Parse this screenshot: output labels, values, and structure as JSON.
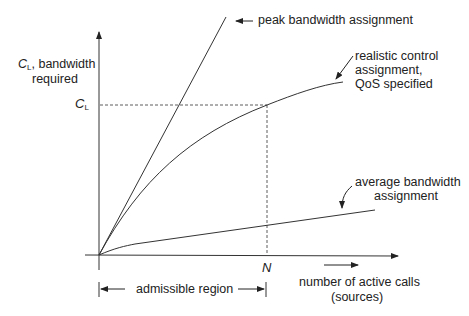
{
  "diagram": {
    "y_axis_label": {
      "symbol": "C",
      "subscript": "L",
      "text_line1": ", bandwidth",
      "text_line2": "required"
    },
    "y_marker": {
      "symbol": "C",
      "subscript": "L"
    },
    "x_marker": "N",
    "x_axis_label": {
      "line1": "number of active calls",
      "line2": "(sources)"
    },
    "region_label": "admissible region",
    "curves": [
      {
        "id": "peak",
        "label": "peak bandwidth assignment"
      },
      {
        "id": "realistic",
        "label_line1": "realistic control",
        "label_line2": "assignment,",
        "label_line3": "QoS specified"
      },
      {
        "id": "average",
        "label_line1": "average bandwidth",
        "label_line2": "assignment"
      }
    ],
    "line_color": "#333333"
  }
}
